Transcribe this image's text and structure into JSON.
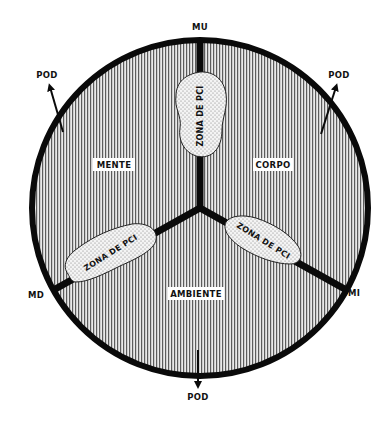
{
  "diagram": {
    "type": "circle-three-sector",
    "center_label": "",
    "axis_labels": {
      "top": "MU",
      "left_bottom": "MD",
      "right_bottom": "MI"
    },
    "sectors": [
      {
        "id": "mente",
        "label": "MENTE",
        "position": "upper-left"
      },
      {
        "id": "corpo",
        "label": "CORPO",
        "position": "upper-right"
      },
      {
        "id": "ambiente",
        "label": "AMBIENTE",
        "position": "bottom"
      }
    ],
    "zones": [
      {
        "id": "zona-top",
        "label": "ZONA DE PCI",
        "on_divider": "top"
      },
      {
        "id": "zona-left",
        "label": "ZONA DE PCI",
        "on_divider": "lower-left"
      },
      {
        "id": "zona-right",
        "label": "ZONA DE PCI",
        "on_divider": "lower-right"
      }
    ],
    "arrows": [
      {
        "id": "pod-upper-left",
        "label": "POD",
        "direction": "outward-upper-left"
      },
      {
        "id": "pod-upper-right",
        "label": "POD",
        "direction": "outward-upper-right"
      },
      {
        "id": "pod-bottom",
        "label": "POD",
        "direction": "outward-down"
      }
    ],
    "colors": {
      "outline": "#0a0a0a",
      "hatch": "#6a6a6a",
      "fill": "#e6e6e6",
      "zone_fill": "#f2f2f2"
    }
  }
}
